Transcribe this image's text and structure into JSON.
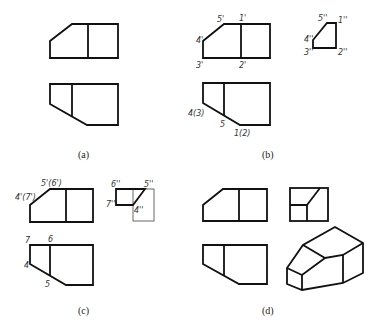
{
  "panels": {
    "a": {
      "caption": "(a)"
    },
    "b": {
      "caption": "(b)",
      "front_labels": {
        "p5": "5'",
        "p1": "1'",
        "p4": "4'",
        "p3": "3'",
        "p2": "2'"
      },
      "side_labels": {
        "p5": "5''",
        "p1": "1''",
        "p4": "4''",
        "p3": "3''",
        "p2": "2''"
      },
      "top_labels": {
        "p43": "4(3)",
        "p5": "5",
        "p12": "1(2)"
      }
    },
    "c": {
      "caption": "(c)",
      "front_labels": {
        "p56": "5'(6')",
        "p47": "4'(7')"
      },
      "side_labels": {
        "p6": "6''",
        "p5": "5''",
        "p7": "7''",
        "p4": "4''"
      },
      "top_labels": {
        "p7": "7",
        "p6": "6",
        "p4": "4",
        "p5": "5"
      }
    },
    "d": {
      "caption": "(d)"
    }
  }
}
